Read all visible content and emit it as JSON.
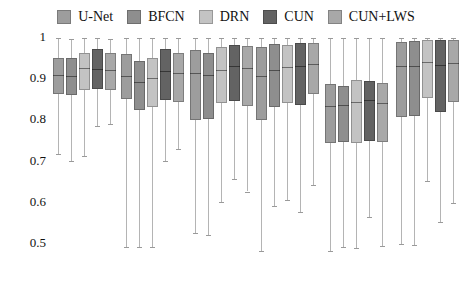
{
  "chart_data": {
    "type": "box",
    "title": "",
    "xlabel": "",
    "ylabel": "",
    "ylim": [
      0.45,
      1.02
    ],
    "yticks": [
      1,
      0.9,
      0.8,
      0.7,
      0.6,
      0.5
    ],
    "ytick_labels": [
      "1",
      "0.9",
      "0.8",
      "0.7",
      "0.6",
      "0.5"
    ],
    "grid": false,
    "legend_position": "top-center",
    "series": [
      {
        "name": "U-Net",
        "color": "#9d9d9d"
      },
      {
        "name": "BFCN",
        "color": "#8e8e8e"
      },
      {
        "name": "DRN",
        "color": "#c3c3c3"
      },
      {
        "name": "CUN",
        "color": "#636363"
      },
      {
        "name": "CUN+LWS",
        "color": "#a8a8a8"
      }
    ],
    "groups": [
      {
        "name": "group-1",
        "boxes": [
          {
            "series": "U-Net",
            "whisker_low": 0.715,
            "q1": 0.862,
            "median": 0.908,
            "q3": 0.948,
            "whisker_high": 0.998
          },
          {
            "series": "BFCN",
            "whisker_low": 0.7,
            "q1": 0.86,
            "median": 0.906,
            "q3": 0.948,
            "whisker_high": 0.995
          },
          {
            "series": "DRN",
            "whisker_low": 0.71,
            "q1": 0.872,
            "median": 0.924,
            "q3": 0.962,
            "whisker_high": 0.998
          },
          {
            "series": "CUN",
            "whisker_low": 0.785,
            "q1": 0.874,
            "median": 0.922,
            "q3": 0.972,
            "whisker_high": 0.998
          },
          {
            "series": "CUN+LWS",
            "whisker_low": 0.79,
            "q1": 0.872,
            "median": 0.92,
            "q3": 0.962,
            "whisker_high": 0.996
          }
        ]
      },
      {
        "name": "group-2",
        "boxes": [
          {
            "series": "U-Net",
            "whisker_low": 0.49,
            "q1": 0.85,
            "median": 0.906,
            "q3": 0.958,
            "whisker_high": 0.998
          },
          {
            "series": "BFCN",
            "whisker_low": 0.49,
            "q1": 0.822,
            "median": 0.89,
            "q3": 0.942,
            "whisker_high": 0.998
          },
          {
            "series": "DRN",
            "whisker_low": 0.49,
            "q1": 0.83,
            "median": 0.9,
            "q3": 0.95,
            "whisker_high": 0.998
          },
          {
            "series": "CUN",
            "whisker_low": 0.7,
            "q1": 0.848,
            "median": 0.918,
            "q3": 0.97,
            "whisker_high": 0.998
          },
          {
            "series": "CUN+LWS",
            "whisker_low": 0.728,
            "q1": 0.842,
            "median": 0.912,
            "q3": 0.962,
            "whisker_high": 0.998
          }
        ]
      },
      {
        "name": "group-3",
        "boxes": [
          {
            "series": "U-Net",
            "whisker_low": 0.525,
            "q1": 0.798,
            "median": 0.912,
            "q3": 0.968,
            "whisker_high": 0.998
          },
          {
            "series": "BFCN",
            "whisker_low": 0.52,
            "q1": 0.8,
            "median": 0.908,
            "q3": 0.962,
            "whisker_high": 0.998
          },
          {
            "series": "DRN",
            "whisker_low": 0.6,
            "q1": 0.84,
            "median": 0.92,
            "q3": 0.975,
            "whisker_high": 0.998
          },
          {
            "series": "CUN",
            "whisker_low": 0.655,
            "q1": 0.845,
            "median": 0.93,
            "q3": 0.98,
            "whisker_high": 0.998
          },
          {
            "series": "CUN+LWS",
            "whisker_low": 0.625,
            "q1": 0.832,
            "median": 0.925,
            "q3": 0.978,
            "whisker_high": 0.998
          }
        ]
      },
      {
        "name": "group-4",
        "boxes": [
          {
            "series": "U-Net",
            "whisker_low": 0.48,
            "q1": 0.798,
            "median": 0.905,
            "q3": 0.975,
            "whisker_high": 0.998
          },
          {
            "series": "BFCN",
            "whisker_low": 0.59,
            "q1": 0.83,
            "median": 0.92,
            "q3": 0.982,
            "whisker_high": 0.998
          },
          {
            "series": "DRN",
            "whisker_low": 0.605,
            "q1": 0.84,
            "median": 0.928,
            "q3": 0.98,
            "whisker_high": 0.998
          },
          {
            "series": "CUN",
            "whisker_low": 0.575,
            "q1": 0.836,
            "median": 0.93,
            "q3": 0.985,
            "whisker_high": 0.998
          },
          {
            "series": "CUN+LWS",
            "whisker_low": 0.64,
            "q1": 0.862,
            "median": 0.935,
            "q3": 0.985,
            "whisker_high": 0.998
          }
        ]
      },
      {
        "name": "group-5",
        "boxes": [
          {
            "series": "U-Net",
            "whisker_low": 0.48,
            "q1": 0.742,
            "median": 0.832,
            "q3": 0.885,
            "whisker_high": 0.998
          },
          {
            "series": "BFCN",
            "whisker_low": 0.49,
            "q1": 0.745,
            "median": 0.836,
            "q3": 0.882,
            "whisker_high": 0.998
          },
          {
            "series": "DRN",
            "whisker_low": 0.488,
            "q1": 0.742,
            "median": 0.842,
            "q3": 0.895,
            "whisker_high": 0.998
          },
          {
            "series": "CUN",
            "whisker_low": 0.562,
            "q1": 0.748,
            "median": 0.848,
            "q3": 0.892,
            "whisker_high": 0.998
          },
          {
            "series": "CUN+LWS",
            "whisker_low": 0.492,
            "q1": 0.745,
            "median": 0.84,
            "q3": 0.888,
            "whisker_high": 0.998
          }
        ]
      },
      {
        "name": "group-6",
        "boxes": [
          {
            "series": "U-Net",
            "whisker_low": 0.498,
            "q1": 0.805,
            "median": 0.93,
            "q3": 0.988,
            "whisker_high": 0.998
          },
          {
            "series": "BFCN",
            "whisker_low": 0.495,
            "q1": 0.808,
            "median": 0.93,
            "q3": 0.99,
            "whisker_high": 0.998
          },
          {
            "series": "DRN",
            "whisker_low": 0.65,
            "q1": 0.852,
            "median": 0.94,
            "q3": 0.992,
            "whisker_high": 0.998
          },
          {
            "series": "CUN",
            "whisker_low": 0.552,
            "q1": 0.818,
            "median": 0.932,
            "q3": 0.992,
            "whisker_high": 0.998
          },
          {
            "series": "CUN+LWS",
            "whisker_low": 0.598,
            "q1": 0.842,
            "median": 0.938,
            "q3": 0.992,
            "whisker_high": 0.998
          }
        ]
      }
    ]
  },
  "legend": {
    "items": [
      {
        "label": "U-Net",
        "color": "#9d9d9d"
      },
      {
        "label": "BFCN",
        "color": "#8e8e8e"
      },
      {
        "label": "DRN",
        "color": "#c3c3c3"
      },
      {
        "label": "CUN",
        "color": "#636363"
      },
      {
        "label": "CUN+LWS",
        "color": "#a8a8a8"
      }
    ]
  },
  "axis": {
    "y_labels": [
      "1",
      "0.9",
      "0.8",
      "0.7",
      "0.6",
      "0.5"
    ]
  },
  "layout": {
    "y_top_px": 37,
    "y_bottom_px": 243,
    "y_top_val": 1.0,
    "y_bottom_val": 0.5,
    "group_starts_px": [
      53,
      121,
      190,
      256,
      325,
      396
    ],
    "box_width_px": 11,
    "box_gap_px": 2
  }
}
